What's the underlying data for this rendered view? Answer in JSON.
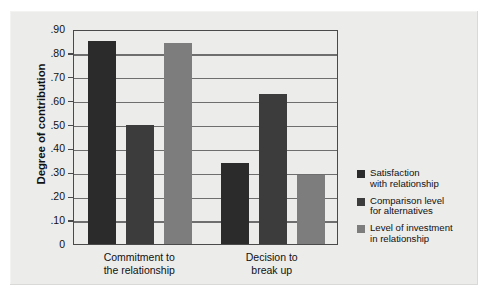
{
  "chart_data": {
    "type": "bar",
    "title": "",
    "xlabel": "",
    "ylabel": "Degree of contribution",
    "ylim": [
      0,
      0.9
    ],
    "grid": true,
    "legend_position": "right",
    "categories": [
      "Commitment to the relationship",
      "Decision to break up"
    ],
    "category_lines": [
      [
        "Commitment to",
        "the relationship"
      ],
      [
        "Decision to",
        "break up"
      ]
    ],
    "ytick_labels": [
      "0",
      ".10",
      ".20",
      ".30",
      ".40",
      ".50",
      ".60",
      ".70",
      ".80",
      ".90"
    ],
    "ytick_values": [
      0,
      0.1,
      0.2,
      0.3,
      0.4,
      0.5,
      0.6,
      0.7,
      0.8,
      0.9
    ],
    "series": [
      {
        "name": "Satisfaction with relationship",
        "name_lines": [
          "Satisfaction",
          "with relationship"
        ],
        "color": "#2b2b2b",
        "values": [
          0.85,
          0.34
        ]
      },
      {
        "name": "Comparison level for alternatives",
        "name_lines": [
          "Comparison level",
          "for alternatives"
        ],
        "color": "#3c3c3c",
        "values": [
          0.5,
          0.63
        ]
      },
      {
        "name": "Level of investment in relationship",
        "name_lines": [
          "Level of investment",
          "in relationship"
        ],
        "color": "#7d7d7d",
        "values": [
          0.84,
          0.29
        ]
      }
    ]
  },
  "colors": {
    "page_background": "#ffffff",
    "panel_background": "#ececeb",
    "axis": "#4a4a4a",
    "gridline": "#6e6e6e",
    "text": "#111111"
  }
}
